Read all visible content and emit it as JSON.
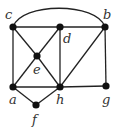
{
  "diagram": {
    "type": "graph",
    "nodes": [
      {
        "id": "c",
        "label": "c",
        "x": 13,
        "y": 27,
        "lx": 5,
        "ly": 19
      },
      {
        "id": "d",
        "label": "d",
        "x": 60,
        "y": 27,
        "lx": 63,
        "ly": 43
      },
      {
        "id": "b",
        "label": "b",
        "x": 105,
        "y": 27,
        "lx": 103,
        "ly": 19
      },
      {
        "id": "e",
        "label": "e",
        "x": 37,
        "y": 56,
        "lx": 33,
        "ly": 74
      },
      {
        "id": "a",
        "label": "a",
        "x": 13,
        "y": 87,
        "lx": 9,
        "ly": 104
      },
      {
        "id": "h",
        "label": "h",
        "x": 60,
        "y": 87,
        "lx": 56,
        "ly": 104
      },
      {
        "id": "g",
        "label": "g",
        "x": 106,
        "y": 86,
        "lx": 102,
        "ly": 104
      },
      {
        "id": "f",
        "label": "f",
        "x": 36,
        "y": 105,
        "lx": 32,
        "ly": 124
      }
    ],
    "edges": [
      [
        "c",
        "d"
      ],
      [
        "d",
        "b"
      ],
      [
        "c",
        "a"
      ],
      [
        "c",
        "e"
      ],
      [
        "e",
        "h"
      ],
      [
        "d",
        "e"
      ],
      [
        "e",
        "a"
      ],
      [
        "d",
        "h"
      ],
      [
        "b",
        "h"
      ],
      [
        "b",
        "g"
      ],
      [
        "a",
        "h"
      ],
      [
        "h",
        "g"
      ],
      [
        "a",
        "f"
      ],
      [
        "f",
        "h"
      ]
    ],
    "arc_edges": [
      [
        "c",
        "b"
      ]
    ]
  }
}
